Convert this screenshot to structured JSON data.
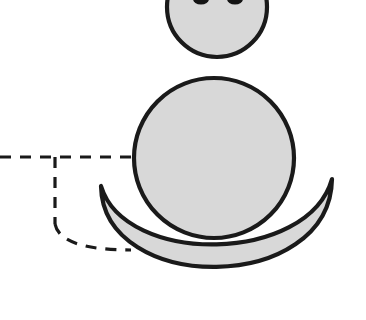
{
  "figure": {
    "title": "",
    "canvas": {
      "width": 366,
      "height": 320,
      "background": "#ffffff"
    },
    "style": {
      "fill_color": "#d8d8d8",
      "stroke_color": "#1a1a1a",
      "dash_color": "#1a1a1a",
      "eye_color": "#141414",
      "shape_stroke_width": 4.2,
      "dash_stroke_width": 3.2,
      "dash_pattern": "11 9"
    },
    "shapes": [
      {
        "name": "head-circle",
        "kind": "circle",
        "label": "head",
        "cx": 217,
        "cy": 7,
        "r": 50,
        "clipped_by": "top-edge",
        "fill": "#d8d8d8",
        "stroke": "#1a1a1a"
      },
      {
        "name": "left-eye",
        "kind": "ellipse",
        "label": "left eye",
        "cx": 201,
        "cy": -1,
        "rx": 8,
        "ry": 5.5,
        "fill": "#141414"
      },
      {
        "name": "right-eye",
        "kind": "ellipse",
        "label": "right eye",
        "cx": 235,
        "cy": -1,
        "rx": 8,
        "ry": 5.5,
        "fill": "#141414"
      },
      {
        "name": "body-circle",
        "kind": "circle",
        "label": "body",
        "cx": 214,
        "cy": 158,
        "r": 80,
        "fill": "#d8d8d8",
        "stroke": "#1a1a1a"
      },
      {
        "name": "crescent-bowl",
        "kind": "crescent",
        "label": "bowl",
        "left_tip": {
          "x": 101,
          "y": 186
        },
        "right_tip": {
          "x": 332,
          "y": 179
        },
        "bottom_outer": {
          "x": 217,
          "y": 289
        },
        "bottom_inner": {
          "x": 217,
          "y": 256
        },
        "fill": "#d8d8d8",
        "stroke": "#1a1a1a"
      }
    ],
    "annotations": [
      {
        "name": "horizontal-guide",
        "kind": "dashed-line",
        "orientation": "horizontal",
        "from": {
          "x": 0,
          "y": 157
        },
        "to": {
          "x": 136,
          "y": 157
        }
      },
      {
        "name": "vertical-guide",
        "kind": "dashed-line",
        "orientation": "vertical",
        "from": {
          "x": 55,
          "y": 157
        },
        "to": {
          "x": 55,
          "y": 224
        }
      },
      {
        "name": "curved-guide",
        "kind": "dashed-arc",
        "from": {
          "x": 55,
          "y": 224
        },
        "to": {
          "x": 131,
          "y": 250
        },
        "control": {
          "x": 60,
          "y": 250
        }
      }
    ]
  }
}
